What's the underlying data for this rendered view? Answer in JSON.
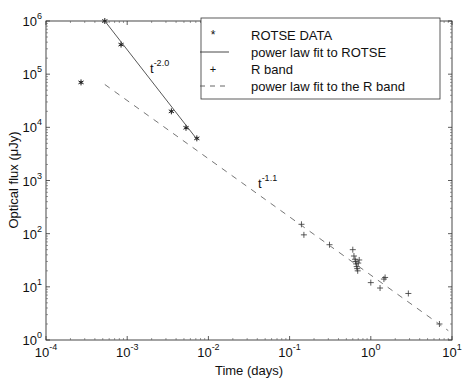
{
  "chart_data": {
    "type": "scatter",
    "title": "",
    "xlabel": "Time (days)",
    "ylabel": "Optical flux (μJy)",
    "xscale": "log",
    "yscale": "log",
    "xlim": [
      0.0001,
      10
    ],
    "ylim": [
      1,
      1000000
    ],
    "xticks": [
      "10^-4",
      "10^-3",
      "10^-2",
      "10^-1",
      "10^0",
      "10^1"
    ],
    "yticks": [
      "10^0",
      "10^1",
      "10^2",
      "10^3",
      "10^4",
      "10^5",
      "10^6"
    ],
    "grid": false,
    "legend_position": "upper right",
    "series": [
      {
        "name": "ROTSE DATA",
        "marker": "*",
        "x": [
          0.00027,
          0.00053,
          0.00084,
          0.0035,
          0.0053,
          0.0072
        ],
        "y": [
          70000,
          1000000,
          360000,
          20000,
          9800,
          6200
        ]
      },
      {
        "name": "power law fit to ROTSE",
        "style": "solid",
        "x": [
          0.00053,
          0.0072
        ],
        "y": [
          1000000,
          6000
        ],
        "annotation": "t^-2.0"
      },
      {
        "name": "R band",
        "marker": "+",
        "x": [
          0.14,
          0.15,
          0.31,
          0.6,
          0.62,
          0.64,
          0.65,
          0.66,
          0.67,
          0.68,
          0.69,
          0.7,
          0.72,
          1.0,
          1.3,
          1.45,
          1.5,
          2.9,
          7.0
        ],
        "y": [
          150,
          95,
          62,
          50,
          38,
          33,
          30,
          27,
          24,
          22,
          20,
          28,
          32,
          12,
          9.5,
          14,
          15,
          7.5,
          2.0
        ]
      },
      {
        "name": "power law fit to the R band",
        "style": "dashed",
        "x": [
          0.00053,
          9.0
        ],
        "y": [
          64000,
          1.5
        ],
        "annotation": "t^-1.1"
      }
    ],
    "annotations": [
      {
        "text": "t",
        "exp": "-2.0",
        "x": 0.0011,
        "y": 150000
      },
      {
        "text": "t",
        "exp": "-1.1",
        "x": 0.05,
        "y": 500
      }
    ]
  },
  "labels": {
    "xlabel": "Time (days)",
    "ylabel": "Optical flux (μJy)",
    "ann1_base": "t",
    "ann1_exp": "-2.0",
    "ann2_base": "t",
    "ann2_exp": "-1.1",
    "legend": [
      "ROTSE DATA",
      "power law fit to ROTSE",
      "R band",
      "power law fit to the R band"
    ]
  }
}
